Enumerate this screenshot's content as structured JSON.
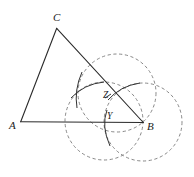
{
  "diagram": {
    "type": "geometric-construction",
    "points": {
      "A": {
        "label": "A",
        "x": 20.7,
        "y": 121.7
      },
      "B": {
        "label": "B",
        "x": 143.3,
        "y": 122.5
      },
      "C": {
        "label": "C",
        "x": 56.7,
        "y": 28.3
      },
      "Z": {
        "label": "Z",
        "x": 112,
        "y": 97
      },
      "Y": {
        "label": "Y",
        "x": 106,
        "y": 122
      }
    },
    "labels": {
      "A": "A",
      "B": "B",
      "C": "C",
      "Z": "Z",
      "Y": "Y"
    },
    "segments": [
      "AB",
      "BC",
      "CA"
    ],
    "dashed_circles": [
      {
        "name": "circle-on-bc",
        "cx": 117,
        "cy": 93,
        "r": 39
      },
      {
        "name": "circle-on-ab",
        "cx": 104,
        "cy": 121,
        "r": 39
      },
      {
        "name": "circle-at-b",
        "cx": 143,
        "cy": 122,
        "r": 39
      }
    ],
    "colors": {
      "lines": "#2a2a2a",
      "dashed": "#7a7a7a",
      "background": "#ffffff"
    }
  }
}
